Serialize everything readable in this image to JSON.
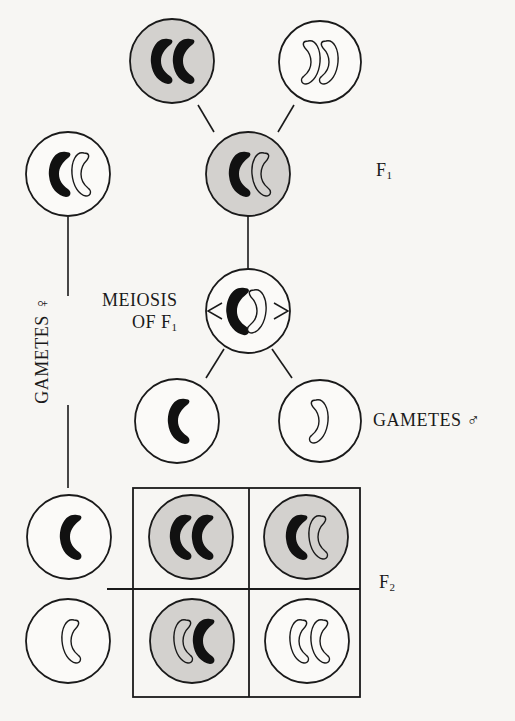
{
  "diagram": {
    "colors": {
      "background": "#f7f6f3",
      "stroke": "#1a1a1a",
      "shaded_cell": "#d3d1ce",
      "white_cell": "#fbfaf8",
      "chromosome_dark": "#111111"
    },
    "labels": {
      "f1": "F",
      "f1_sub": "1",
      "meiosis_line1": "MEIOSIS",
      "meiosis_line2": "OF F",
      "meiosis_sub": "1",
      "gametes_female": "GAMETES ♀",
      "gametes_male": "GAMETES ♂",
      "f2": "F",
      "f2_sub": "2"
    },
    "cells": [
      {
        "id": "parent-dominant",
        "shaded": true,
        "chromosomes": [
          "dark",
          "dark"
        ]
      },
      {
        "id": "parent-recessive",
        "shaded": false,
        "chromosomes": [
          "light",
          "light"
        ]
      },
      {
        "id": "f1-female-left",
        "shaded": false,
        "chromosomes": [
          "dark",
          "light"
        ]
      },
      {
        "id": "f1-hybrid",
        "shaded": true,
        "chromosomes": [
          "dark",
          "light"
        ]
      },
      {
        "id": "meiosis-f1",
        "shaded": false,
        "chromosomes": [
          "dark",
          "light"
        ]
      },
      {
        "id": "gamete-male-dark",
        "shaded": false,
        "chromosomes": [
          "dark"
        ]
      },
      {
        "id": "gamete-male-light",
        "shaded": false,
        "chromosomes": [
          "light"
        ]
      },
      {
        "id": "gamete-female-dark",
        "shaded": false,
        "chromosomes": [
          "dark"
        ]
      },
      {
        "id": "gamete-female-light",
        "shaded": false,
        "chromosomes": [
          "light"
        ]
      },
      {
        "id": "f2-dd",
        "shaded": true,
        "chromosomes": [
          "dark",
          "dark"
        ]
      },
      {
        "id": "f2-dl",
        "shaded": true,
        "chromosomes": [
          "dark",
          "light"
        ]
      },
      {
        "id": "f2-ld",
        "shaded": true,
        "chromosomes": [
          "light",
          "dark"
        ]
      },
      {
        "id": "f2-ll",
        "shaded": false,
        "chromosomes": [
          "light",
          "light"
        ]
      }
    ]
  }
}
